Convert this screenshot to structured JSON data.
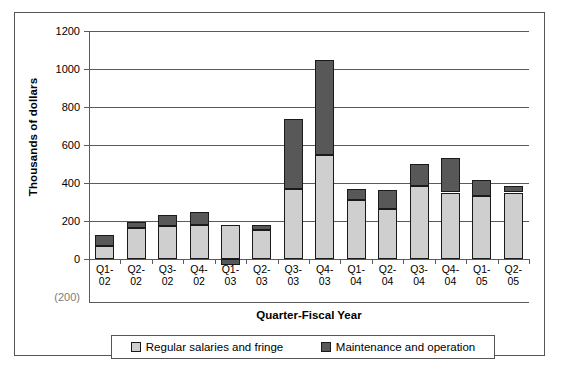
{
  "chart_data": {
    "type": "bar",
    "subtype": "stacked-column",
    "title": "",
    "xlabel": "Quarter-Fiscal Year",
    "ylabel": "Thousands of dollars",
    "categories": [
      "Q1-02",
      "Q2-02",
      "Q3-02",
      "Q4-02",
      "Q1-03",
      "Q2-03",
      "Q3-03",
      "Q4-03",
      "Q1-04",
      "Q2-04",
      "Q3-04",
      "Q4-04",
      "Q1-05",
      "Q2-05"
    ],
    "category_lines": [
      [
        "Q1-",
        "02"
      ],
      [
        "Q2-",
        "02"
      ],
      [
        "Q3-",
        "02"
      ],
      [
        "Q4-",
        "02"
      ],
      [
        "Q1-",
        "03"
      ],
      [
        "Q2-",
        "03"
      ],
      [
        "Q3-",
        "03"
      ],
      [
        "Q4-",
        "03"
      ],
      [
        "Q1-",
        "04"
      ],
      [
        "Q2-",
        "04"
      ],
      [
        "Q3-",
        "04"
      ],
      [
        "Q4-",
        "04"
      ],
      [
        "Q1-",
        "05"
      ],
      [
        "Q2-",
        "05"
      ]
    ],
    "series": [
      {
        "name": "Regular salaries and fringe",
        "color": "#cfcfcf",
        "values": [
          70,
          165,
          175,
          180,
          180,
          155,
          370,
          550,
          310,
          265,
          385,
          350,
          330,
          350
        ]
      },
      {
        "name": "Maintenance and operation",
        "color": "#585858",
        "values": [
          55,
          30,
          55,
          65,
          -30,
          25,
          365,
          500,
          60,
          100,
          115,
          180,
          85,
          35
        ]
      }
    ],
    "totals": [
      125,
      195,
      230,
      245,
      150,
      180,
      735,
      1050,
      370,
      365,
      500,
      530,
      415,
      385
    ],
    "ylim": [
      -200,
      1200
    ],
    "yticks": [
      1200,
      1000,
      800,
      600,
      400,
      200,
      0,
      -200
    ],
    "ytick_labels": [
      "1200",
      "1000",
      "800",
      "600",
      "400",
      "200",
      "0",
      "(200)"
    ],
    "grid": true,
    "legend_position": "bottom"
  },
  "legend": {
    "entries": [
      {
        "label": "Regular salaries and fringe",
        "color": "#cfcfcf"
      },
      {
        "label": "Maintenance and operation",
        "color": "#585858"
      }
    ]
  }
}
